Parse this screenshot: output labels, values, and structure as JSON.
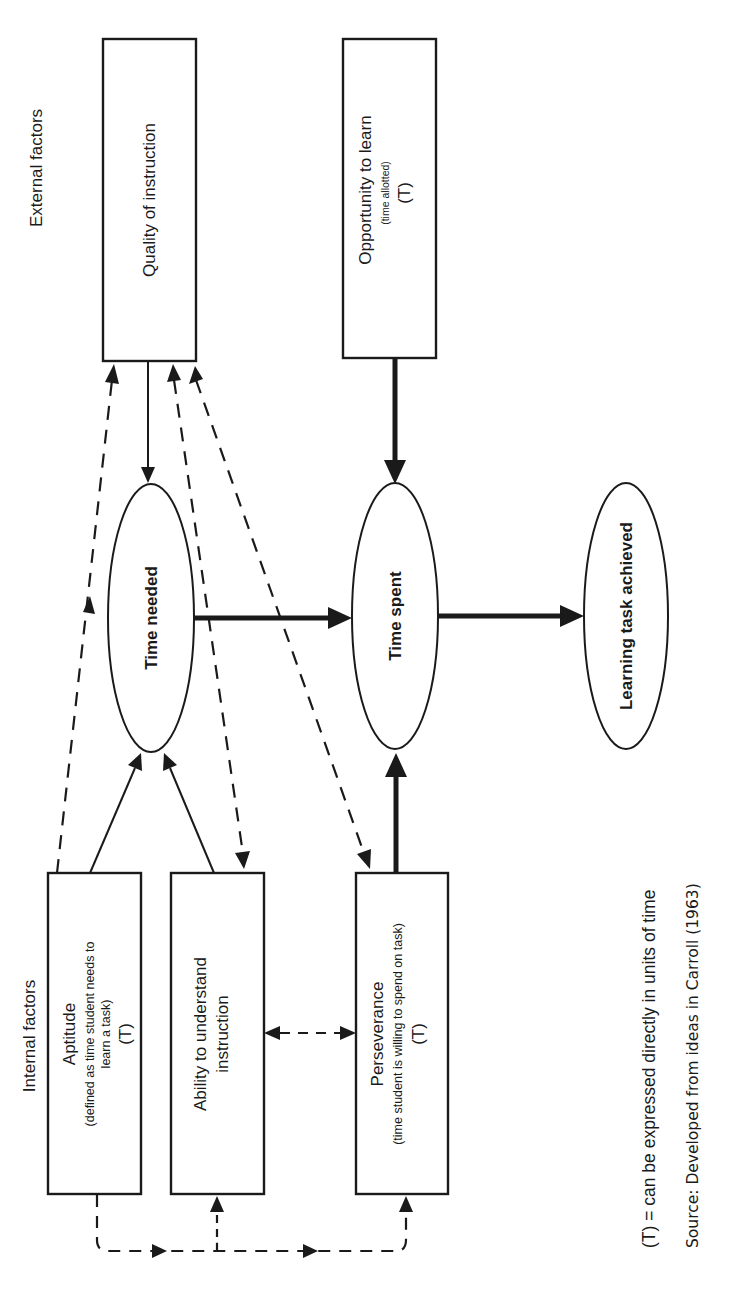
{
  "headers": {
    "external": "External factors",
    "internal": "Internal factors"
  },
  "nodes": {
    "quality": {
      "title": "Quality of instruction"
    },
    "opportunity": {
      "title": "Opportunity to learn",
      "subtitle": "(time allotted)",
      "marker": "(T)"
    },
    "aptitude": {
      "title": "Aptitude",
      "subtitle_line1": "(defined as time student needs to",
      "subtitle_line2": "learn a task)",
      "marker": "(T)"
    },
    "ability": {
      "title_line1": "Ability to understand",
      "title_line2": "instruction"
    },
    "perseverance": {
      "title": "Perseverance",
      "subtitle": "(time student is willing to spend on task)",
      "marker": "(T)"
    },
    "time_needed": {
      "title": "Time needed"
    },
    "time_spent": {
      "title": "Time spent"
    },
    "learning": {
      "title": "Learning task achieved"
    }
  },
  "legend": {
    "note": "(T) = can be expressed directly in units of time",
    "source": "Source: Developed from ideas in Carroll (1963)"
  }
}
